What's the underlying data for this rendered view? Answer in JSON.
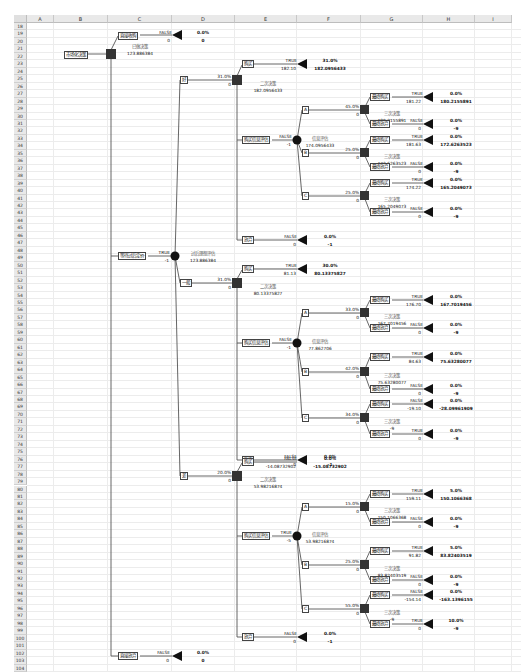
{
  "sheet": {
    "columns": [
      "A",
      "B",
      "C",
      "D",
      "E",
      "F",
      "G",
      "H",
      "I"
    ],
    "row_start": 18,
    "row_end": 104
  },
  "tree": {
    "root": {
      "label": "市场化决策"
    },
    "top_decision": {
      "name": "已做决策",
      "value": "123.886384"
    },
    "branch_keep": {
      "label": "直接收购",
      "flag": "FALSE",
      "cost": "0",
      "prob": "0.0%",
      "value": "0"
    },
    "branch_wait": {
      "label": "等待过后定价",
      "flag": "TRUE",
      "cost": "-1",
      "chance_name": "过后理想评估",
      "chance_value": "123.886384"
    },
    "branch_drop": {
      "label": "直接放弃",
      "flag": "FALSE",
      "cost": "0",
      "prob": "0.0%",
      "value": "0"
    },
    "high": {
      "label": "好",
      "prob": "31.0%",
      "cost": "0",
      "decision_name": "二次决策",
      "decision_value": "182.0956433",
      "buy": {
        "label": "购买",
        "flag": "TRUE",
        "cost": "182.10",
        "prob": "31.0%",
        "value": "182.0956433"
      },
      "research": {
        "label": "购买信息评估",
        "flag": "FALSE",
        "cost": "-1",
        "chance_name": "信息评估",
        "chance_value": "174.0956433"
      },
      "giveup": {
        "label": "放弃",
        "flag": "FALSE",
        "cost": "0",
        "prob": "0.0%",
        "value": "-1"
      },
      "A": {
        "label": "A",
        "prob": "45.0%",
        "cost": "0",
        "decision_name": "三次决策",
        "decision_value": "180.2155891",
        "buy": {
          "label": "最终购买",
          "flag": "TRUE",
          "cost": "181.22",
          "prob": "0.0%",
          "value": "180.2155891"
        },
        "drop": {
          "label": "最终放弃",
          "flag": "FALSE",
          "cost": "0",
          "prob": "0.0%",
          "value": "-9"
        }
      },
      "B": {
        "label": "B",
        "prob": "25.0%",
        "cost": "0",
        "decision_name": "三次决策",
        "decision_value": "172.6263523",
        "buy": {
          "label": "最终购买",
          "flag": "TRUE",
          "cost": "181.63",
          "prob": "0.0%",
          "value": "172.6263523"
        },
        "drop": {
          "label": "最终放弃",
          "flag": "FALSE",
          "cost": "0",
          "prob": "0.0%",
          "value": "-9"
        }
      },
      "C": {
        "label": "C",
        "prob": "25.0%",
        "cost": "0",
        "decision_name": "三次决策",
        "decision_value": "165.2049073",
        "buy": {
          "label": "最终购买",
          "flag": "TRUE",
          "cost": "174.22",
          "prob": "0.0%",
          "value": "165.2049073"
        },
        "drop": {
          "label": "最终放弃",
          "flag": "FALSE",
          "cost": "0",
          "prob": "0.0%",
          "value": "-9"
        }
      }
    },
    "mid": {
      "label": "一般",
      "prob": "31.0%",
      "cost": "0",
      "decision_name": "二次决策",
      "decision_value": "80.13375827",
      "buy": {
        "label": "购买",
        "flag": "TRUE",
        "cost": "81.13",
        "prob": "30.0%",
        "value": "80.13375827"
      },
      "research": {
        "label": "购买信息评估",
        "flag": "FALSE",
        "cost": "-1",
        "chance_name": "信息评估",
        "chance_value": "77.862706"
      },
      "giveup": {
        "label": "放弃",
        "flag": "FALSE",
        "cost": "0",
        "prob": "0.0%",
        "value": "-1"
      },
      "A": {
        "label": "A",
        "prob": "33.0%",
        "cost": "0",
        "decision_name": "三次决策",
        "decision_value": "167.7019456",
        "buy": {
          "label": "最终购买",
          "flag": "TRUE",
          "cost": "176.70",
          "prob": "0.0%",
          "value": "167.7019456"
        },
        "drop": {
          "label": "最终放弃",
          "flag": "FALSE",
          "cost": "0",
          "prob": "0.0%",
          "value": "-9"
        }
      },
      "B": {
        "label": "B",
        "prob": "42.0%",
        "cost": "0",
        "decision_name": "三次决策",
        "decision_value": "75.63280077",
        "buy": {
          "label": "最终购买",
          "flag": "TRUE",
          "cost": "84.63",
          "prob": "0.0%",
          "value": "75.63280077"
        },
        "drop": {
          "label": "最终放弃",
          "flag": "FALSE",
          "cost": "0",
          "prob": "0.0%",
          "value": "-9"
        }
      },
      "C": {
        "label": "C",
        "prob": "34.0%",
        "cost": "0",
        "decision_name": "三次决策",
        "decision_value": "-9",
        "buy": {
          "label": "最终购买",
          "flag": "FALSE",
          "cost": "-19.10",
          "prob": "0.0%",
          "value": "-28.09961909"
        },
        "drop": {
          "label": "最终放弃",
          "flag": "TRUE",
          "cost": "0",
          "prob": "0.0%",
          "value": "-9"
        }
      }
    },
    "low": {
      "label": "差",
      "prob": "20.0%",
      "cost": "0",
      "decision_name": "二次决策",
      "decision_value": "53.98216874",
      "buy": {
        "label": "购买",
        "flag": "FALSE",
        "cost": "-14.08732902",
        "prob": "0.0%",
        "value": "-15.08732902"
      },
      "research": {
        "label": "购买信息评估",
        "flag": "TRUE",
        "cost": "-5",
        "chance_name": "信息评估",
        "chance_value": "53.98216874"
      },
      "giveup": {
        "label": "放弃",
        "flag": "FALSE",
        "cost": "0",
        "prob": "0.0%",
        "value": "-1"
      },
      "A": {
        "label": "A",
        "prob": "15.0%",
        "cost": "0",
        "decision_name": "三次决策",
        "decision_value": "150.1066368",
        "buy": {
          "label": "最终购买",
          "flag": "TRUE",
          "cost": "159.11",
          "prob": "5.0%",
          "value": "150.1066368"
        },
        "drop": {
          "label": "最终放弃",
          "flag": "FALSE",
          "cost": "0",
          "prob": "0.0%",
          "value": "-9"
        }
      },
      "B": {
        "label": "B",
        "prob": "25.0%",
        "cost": "0",
        "decision_name": "三次决策",
        "decision_value": "83.82403519",
        "buy": {
          "label": "最终购买",
          "flag": "TRUE",
          "cost": "91.82",
          "prob": "5.0%",
          "value": "83.82403519"
        },
        "drop": {
          "label": "最终放弃",
          "flag": "FALSE",
          "cost": "0",
          "prob": "0.0%",
          "value": "-9"
        }
      },
      "C": {
        "label": "C",
        "prob": "55.0%",
        "cost": "0",
        "decision_name": "三次决策",
        "decision_value": "-9",
        "buy": {
          "label": "最终购买",
          "flag": "FALSE",
          "cost": "-154.14",
          "prob": "0.0%",
          "value": "-163.1396155"
        },
        "drop": {
          "label": "最终放弃",
          "flag": "TRUE",
          "cost": "0",
          "prob": "10.0%",
          "value": "-9"
        }
      }
    }
  }
}
